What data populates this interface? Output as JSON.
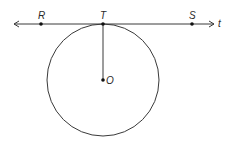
{
  "diagram": {
    "type": "geometry-tangent-line",
    "colors": {
      "stroke": "#3a3a3a",
      "point": "#111111",
      "label": "#2a2a2a",
      "background": "#ffffff"
    },
    "line": {
      "label": "t",
      "y": 24,
      "x1": 14,
      "x2": 214
    },
    "circle": {
      "center_label": "O",
      "cx": 103,
      "cy": 80,
      "r": 56
    },
    "points": [
      {
        "label": "R",
        "x": 41,
        "y": 24
      },
      {
        "label": "T",
        "x": 103,
        "y": 24
      },
      {
        "label": "S",
        "x": 192,
        "y": 24
      },
      {
        "label": "O",
        "x": 103,
        "y": 80
      }
    ],
    "segments": [
      {
        "from": "T",
        "to": "O"
      }
    ]
  }
}
